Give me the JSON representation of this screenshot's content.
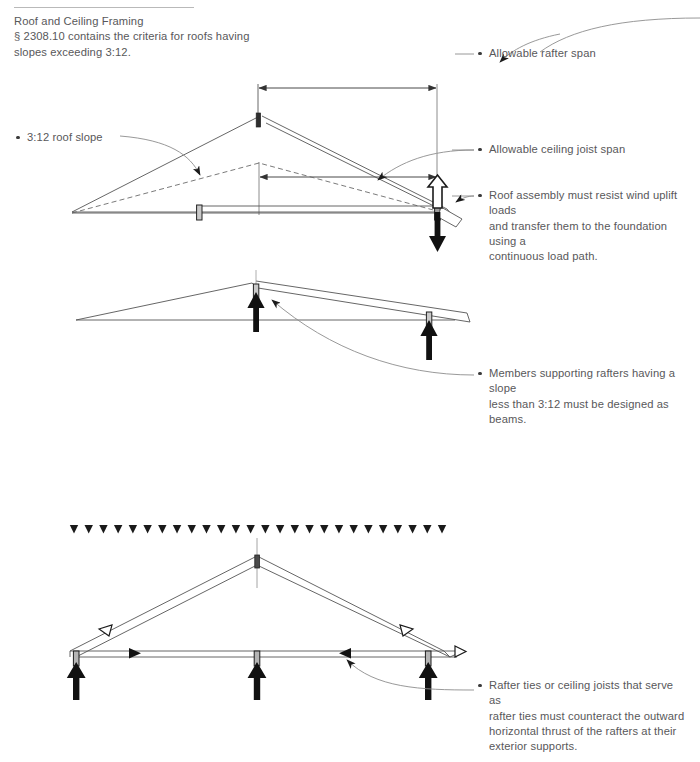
{
  "page": {
    "width": 700,
    "height": 762,
    "background": "#ffffff",
    "text_color": "#58585a"
  },
  "header": {
    "title": "Roof and Ceiling Framing",
    "line2": "§ 2308.10 contains the criteria for roofs having",
    "line3": "slopes exceeding 3:12."
  },
  "callouts": {
    "rafter_span": {
      "label": "Allowable rafter span",
      "lines": [
        "Allowable rafter span"
      ]
    },
    "ceiling_joist_span": {
      "label": "Allowable ceiling joist span",
      "lines": [
        "Allowable ceiling joist span"
      ]
    },
    "wind_uplift": {
      "label": "Roof assembly must resist wind uplift loads and transfer them to the foundation using a continuous load path.",
      "lines": [
        "Roof assembly must resist wind uplift loads",
        "and transfer them to the foundation using a",
        "continuous load path."
      ]
    },
    "members_supporting": {
      "label": "Members supporting rafters having a slope less than 3:12 must be designed as beams.",
      "lines": [
        "Members supporting rafters having a slope",
        "less than 3:12 must be designed as beams."
      ]
    },
    "rafter_ties": {
      "label": "Rafter ties or ceiling joists that serve as rafter ties must counteract the outward horizontal thrust of the rafters at their exterior supports.",
      "lines": [
        "Rafter ties or ceiling joists that serve as",
        "rafter ties must counteract the outward",
        "horizontal thrust of the rafters at their",
        "exterior supports."
      ]
    },
    "roof_slope": {
      "label": "3:12 roof slope",
      "lines": [
        "3:12 roof slope"
      ]
    }
  },
  "diagrams": {
    "top": {
      "name": "steep-slope-truss-with-spans",
      "slope": "3:12",
      "dimension_lines": [
        "allowable rafter span",
        "allowable ceiling joist span"
      ],
      "force_arrows": [
        {
          "type": "uplift",
          "style": "hollow",
          "direction": "up"
        },
        {
          "type": "gravity",
          "style": "solid",
          "direction": "down"
        }
      ]
    },
    "middle": {
      "name": "low-slope-rafter-on-beams",
      "slope": "less than 3:12",
      "force_arrows": [
        {
          "type": "reaction",
          "style": "solid",
          "direction": "up"
        },
        {
          "type": "reaction",
          "style": "solid",
          "direction": "up"
        }
      ]
    },
    "bottom": {
      "name": "gable-truss-with-rafter-ties",
      "distributed_load_arrow_count": 26,
      "force_arrows": [
        {
          "type": "reaction",
          "style": "solid",
          "direction": "up"
        },
        {
          "type": "reaction",
          "style": "solid",
          "direction": "up"
        },
        {
          "type": "reaction",
          "style": "solid",
          "direction": "up"
        },
        {
          "type": "rafter-thrust",
          "style": "hollow",
          "direction": "down-slope"
        },
        {
          "type": "tie-tension",
          "style": "solid",
          "direction": "horizontal"
        },
        {
          "type": "outward-thrust",
          "style": "hollow",
          "direction": "right"
        }
      ]
    }
  },
  "colors": {
    "line": "#555555",
    "line_light": "#8d8d8d",
    "arrow_solid": "#111111",
    "post_fill": "#b4b4b4",
    "text": "#58585a",
    "rule": "#b9b9b9"
  }
}
